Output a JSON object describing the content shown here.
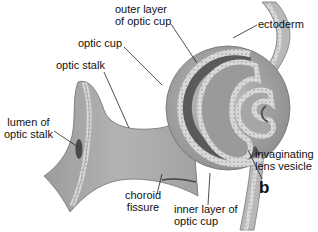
{
  "figure": {
    "panel_letter": "b",
    "colors": {
      "tissue": "#a9a9a9",
      "tissue_light": "#c4c4c4",
      "tissue_dark": "#7d7d7d",
      "epithelium": "#d6d6d6",
      "lumen_dark": "#4a4a4a",
      "leader": "#222222"
    }
  },
  "labels": {
    "outer_layer": [
      "outer layer",
      "of optic cup"
    ],
    "optic_cup": "optic cup",
    "optic_stalk": "optic stalk",
    "lumen": [
      "lumen of",
      "optic stalk"
    ],
    "choroid": [
      "choroid",
      "fissure"
    ],
    "inner_layer": [
      "inner layer of",
      "optic cup"
    ],
    "ectoderm": "ectoderm",
    "lens_vesicle": [
      "invaginating",
      "lens vesicle"
    ]
  }
}
